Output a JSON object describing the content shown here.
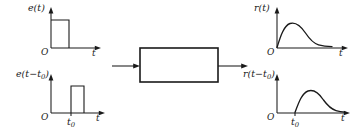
{
  "figure": {
    "background_color": "#ffffff",
    "stroke_color": "#1a1a1a",
    "width": 354,
    "height": 134
  },
  "plots": {
    "input_unshifted": {
      "signal_label": "e(t)",
      "origin_label": "O",
      "axis_label": "t",
      "waveform": "rectangular-pulse",
      "pulse_start": "0",
      "tick_label": ""
    },
    "input_shifted": {
      "signal_label_main": "e(t",
      "signal_label_minus": "−",
      "signal_label_sub": "0",
      "signal_label_tail": ")",
      "signal_label_var": "t",
      "origin_label": "O",
      "axis_label": "t",
      "waveform": "rectangular-pulse",
      "tick_label_main": "t",
      "tick_label_sub": "0"
    },
    "output_unshifted": {
      "signal_label": "r(t)",
      "origin_label": "O",
      "axis_label": "t",
      "waveform": "rise-and-decay-response",
      "tick_label": ""
    },
    "output_shifted": {
      "signal_label_main": "r(t",
      "signal_label_minus": "−",
      "signal_label_sub": "0",
      "signal_label_tail": ")",
      "signal_label_var": "t",
      "origin_label": "O",
      "axis_label": "t",
      "waveform": "rise-and-decay-response",
      "tick_label_main": "t",
      "tick_label_sub": "0"
    }
  },
  "system_block": {
    "label": "",
    "input_arrow": "arrow-right",
    "output_arrow": "arrow-right"
  }
}
